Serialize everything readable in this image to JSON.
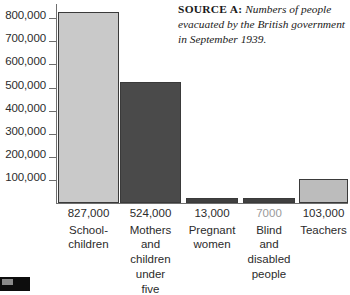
{
  "source_note": {
    "label": "SOURCE A:",
    "text": " Numbers of people evacuated by the British government in September 1939."
  },
  "chart_data": {
    "type": "bar",
    "title": "",
    "subtitle": "",
    "xlabel": "",
    "ylabel": "",
    "ylim": [
      0,
      850000
    ],
    "grid": false,
    "legend": null,
    "axis_tick_labels": [
      "800,000",
      "700,000",
      "600,000",
      "500,000",
      "400,000",
      "300,000",
      "200,000",
      "100,000"
    ],
    "axis_tick_values": [
      800000,
      700000,
      600000,
      500000,
      400000,
      300000,
      200000,
      100000
    ],
    "categories": [
      "School-children",
      "Mothers and children under five",
      "Pregnant women",
      "Blind and disabled people",
      "Teachers"
    ],
    "values": [
      827000,
      524000,
      13000,
      7000,
      103000
    ],
    "value_labels": [
      "827,000",
      "524,000",
      "13,000",
      "7000",
      "103,000"
    ],
    "bar_colors": [
      "#c9c9c9",
      "#4a4a4a",
      "#404040",
      "#404040",
      "#bcbcbc"
    ]
  },
  "bars": [
    {
      "value_label": "827,000",
      "name_lines": [
        "School-",
        "children"
      ],
      "color": "#c9c9c9",
      "label_color": "#2b2b2b"
    },
    {
      "value_label": "524,000",
      "name_lines": [
        "Mothers",
        "and",
        "children",
        "under",
        "five"
      ],
      "color": "#4a4a4a",
      "label_color": "#2b2b2b"
    },
    {
      "value_label": "13,000",
      "name_lines": [
        "Pregnant",
        "women"
      ],
      "color": "#404040",
      "label_color": "#2b2b2b"
    },
    {
      "value_label": "7000",
      "name_lines": [
        "Blind",
        "and",
        "disabled",
        "people"
      ],
      "color": "#404040",
      "label_color": "#9a9a9a"
    },
    {
      "value_label": "103,000",
      "name_lines": [
        "Teachers"
      ],
      "color": "#bcbcbc",
      "label_color": "#2b2b2b"
    }
  ]
}
